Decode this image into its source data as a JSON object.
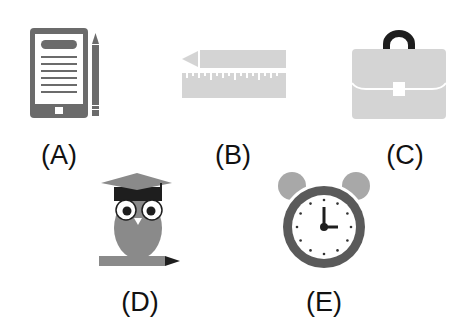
{
  "items": [
    {
      "id": "A",
      "label": "(A)",
      "icon": "tablet-with-pencil-icon"
    },
    {
      "id": "B",
      "label": "(B)",
      "icon": "pencil-and-ruler-icon"
    },
    {
      "id": "C",
      "label": "(C)",
      "icon": "briefcase-icon"
    },
    {
      "id": "D",
      "label": "(D)",
      "icon": "graduate-owl-with-pencil-icon"
    },
    {
      "id": "E",
      "label": "(E)",
      "icon": "alarm-clock-icon"
    }
  ],
  "colors": {
    "dark_gray": "#6b6b6b",
    "light_gray": "#d4d4d4",
    "mid_gray": "#8a8a8a",
    "black": "#1e1e1e",
    "white": "#ffffff"
  },
  "clock": {
    "hour": 3,
    "minute": 0
  }
}
